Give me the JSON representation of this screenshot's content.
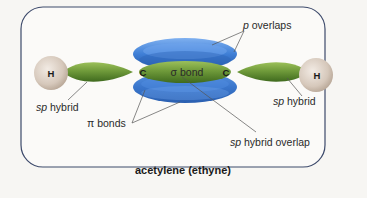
{
  "diagram": {
    "title": "acetylene (ethyne)",
    "atoms": {
      "left_h": "H",
      "right_h": "H",
      "left_c": "C",
      "right_c": "C"
    },
    "labels": {
      "sigma_bond": "σ bond",
      "p_overlaps_italic": "p",
      "p_overlaps_rest": " overlaps",
      "left_sp_italic": "sp",
      "left_sp_rest": " hybrid",
      "right_sp_italic": "sp",
      "right_sp_rest": " hybrid",
      "pi_bonds": "π bonds",
      "sp_overlap_italic": "sp",
      "sp_overlap_rest": " hybrid overlap"
    },
    "colors": {
      "background": "#f7f6f3",
      "frame_border": "#3d4a6b",
      "hydrogen": "#d9ccc0",
      "sp_orbital": "#6f9a3a",
      "p_orbital": "#3f7fd6",
      "leader_line": "#555555"
    }
  }
}
